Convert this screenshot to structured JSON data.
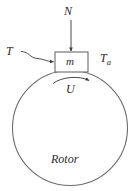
{
  "figure": {
    "type": "engineering-free-body-diagram",
    "stroke_color": "#4a4a4a",
    "text_color": "#2b2b2b",
    "background_color": "#ffffff"
  },
  "labels": {
    "normal_force": "N",
    "torque_left": "T",
    "torque_right_base": "T",
    "torque_right_sub": "a",
    "mass": "m",
    "velocity": "U",
    "body": "Rotor"
  },
  "geometry": {
    "rotor_circle": {
      "cx": 70,
      "cy": 128,
      "r": 58
    },
    "mass_block": {
      "x": 55,
      "y": 52,
      "width": 33,
      "height": 20
    },
    "normal_arrow": {
      "x": 71,
      "y_start": 20,
      "y_end": 52
    },
    "velocity_arc": {
      "x_start": 54,
      "x_end": 90,
      "y": 80
    },
    "torque_leader": {
      "x_start": 22,
      "y_start": 52,
      "x_end": 55,
      "y_end": 62
    }
  }
}
